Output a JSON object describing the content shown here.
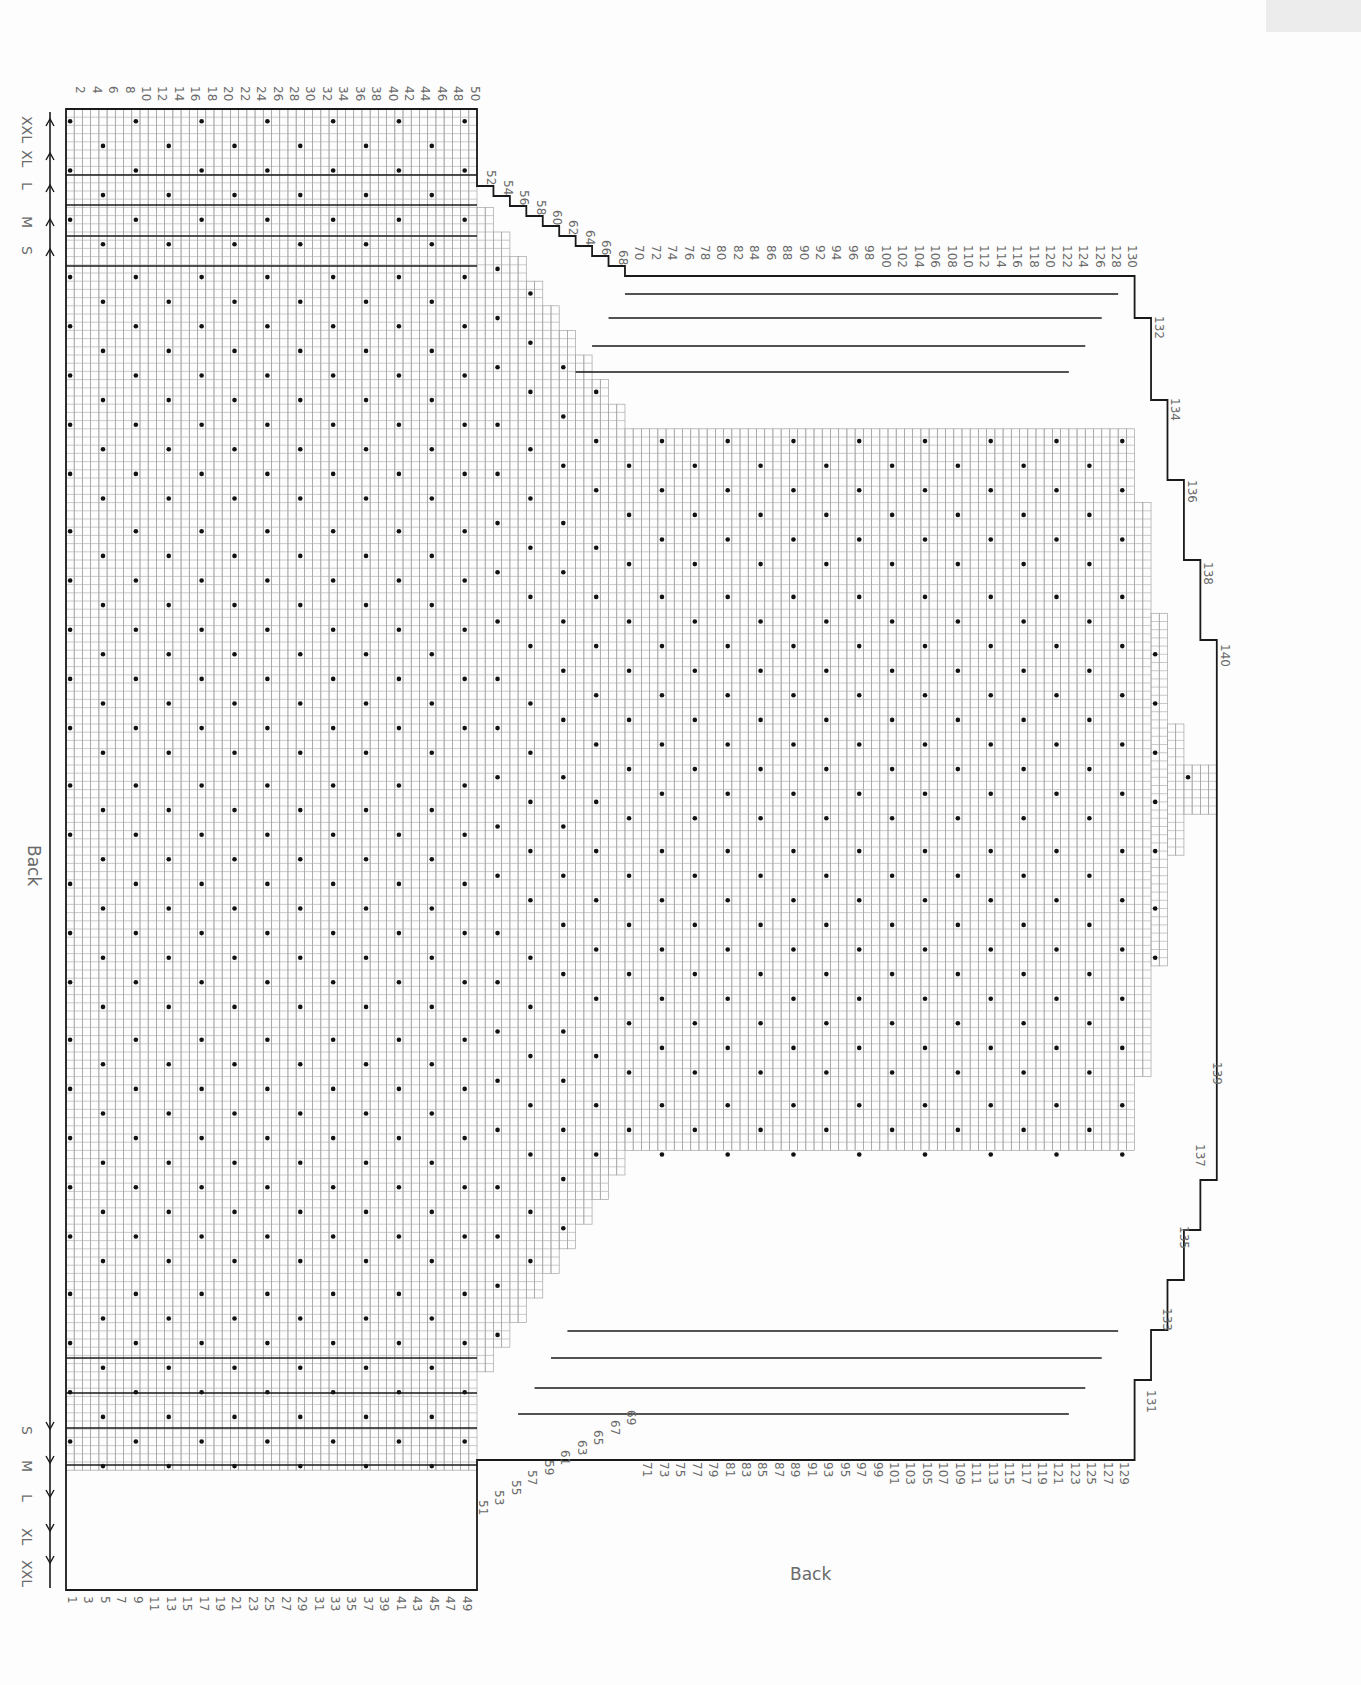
{
  "page": {
    "title_side": "Back",
    "title_bottom": "Back",
    "colors": {
      "background": "#fdfdfd",
      "grid": "#9a9a9a",
      "outline": "#1a1a1a",
      "dot": "#111111",
      "label": "#6a6a6a",
      "corner_tab": "#ececec"
    }
  },
  "sizes_top": [
    "XXL",
    "XL",
    "L",
    "M",
    "S"
  ],
  "sizes_bottom": [
    "S",
    "M",
    "L",
    "XL",
    "XXL"
  ],
  "row_numbers": {
    "top_even_straight": [
      2,
      4,
      6,
      8,
      10,
      12,
      14,
      16,
      18,
      20,
      22,
      24,
      26,
      28,
      30,
      32,
      34,
      36,
      38,
      40,
      42,
      44,
      46,
      48,
      50
    ],
    "top_even_angled": [
      52,
      54,
      56,
      58,
      60,
      62,
      64,
      66,
      68
    ],
    "top_even_long": [
      70,
      72,
      74,
      76,
      78,
      80,
      82,
      84,
      86,
      88,
      90,
      92,
      94,
      96,
      98,
      100,
      102,
      104,
      106,
      108,
      110,
      112,
      114,
      116,
      118,
      120,
      122,
      124,
      126,
      128,
      130
    ],
    "right_even": [
      132,
      134,
      136,
      138,
      140
    ],
    "bottom_odd_straight": [
      1,
      3,
      5,
      7,
      9,
      11,
      13,
      15,
      17,
      19,
      21,
      23,
      25,
      27,
      29,
      31,
      33,
      35,
      37,
      39,
      41,
      43,
      45,
      47,
      49
    ],
    "bottom_odd_angled": [
      51,
      53,
      55,
      57,
      59,
      61,
      63,
      65,
      67,
      69
    ],
    "bottom_odd_long": [
      71,
      73,
      75,
      77,
      79,
      81,
      83,
      85,
      87,
      89,
      91,
      93,
      95,
      97,
      99,
      101,
      103,
      105,
      107,
      109,
      111,
      113,
      115,
      117,
      119,
      121,
      123,
      125,
      127,
      129
    ],
    "right_odd": [
      131,
      133,
      135,
      137,
      139
    ]
  },
  "legend": {
    "dot_symbol": "purl-dot",
    "y_symbol": "increase-Y",
    "lambda_symbol": "decrease-lambda"
  }
}
